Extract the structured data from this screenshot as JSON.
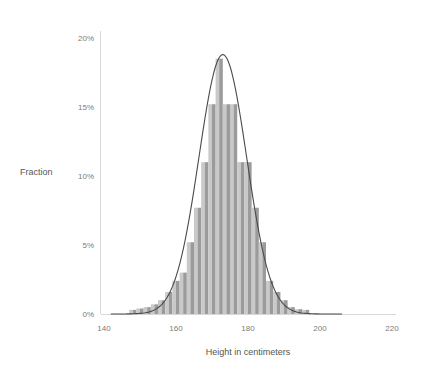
{
  "chart_data": {
    "type": "bar",
    "title": "",
    "subtitle": "",
    "xlabel": "Height in centimeters",
    "ylabel": "Fraction",
    "xlim": [
      140,
      224
    ],
    "ylim": [
      0,
      20
    ],
    "xticks": [
      140,
      160,
      180,
      200,
      220
    ],
    "xtick_labels": [
      "140",
      "160",
      "180",
      "200",
      "220"
    ],
    "yticks": [
      0,
      5,
      10,
      15,
      20
    ],
    "ytick_labels": [
      "0%",
      "5%",
      "10%",
      "15%",
      "20%"
    ],
    "y_unit": "percent",
    "grid": false,
    "legend": null,
    "bin_width": 2,
    "categories": [
      "148",
      "150",
      "152",
      "154",
      "156",
      "158",
      "160",
      "162",
      "164",
      "166",
      "168",
      "170",
      "172",
      "174",
      "176",
      "178",
      "180",
      "182",
      "184",
      "186",
      "188",
      "190",
      "192",
      "194",
      "196"
    ],
    "values": [
      0.3,
      0.4,
      0.5,
      0.7,
      1.0,
      1.6,
      2.4,
      3.0,
      5.2,
      7.7,
      11.0,
      15.2,
      18.5,
      15.2,
      15.2,
      11.0,
      11.0,
      7.7,
      5.2,
      2.4,
      1.6,
      1.0,
      0.5,
      0.35,
      0.3
    ],
    "bar_colors": [
      "#c9c9c9",
      "#9b9b9b"
    ],
    "overlay": {
      "type": "line",
      "name": "normal density curve",
      "color": "#4a4a4a",
      "mean": 173,
      "peak_value": 18.8
    }
  },
  "axes": {
    "x_label": "Height in centimeters",
    "y_label": "Fraction"
  },
  "colors": {
    "background": "#ffffff",
    "axis": "#d8d8d8",
    "tick_text": "#7b7b7b",
    "axis_title": "#555555",
    "bar_light": "#c9c9c9",
    "bar_dark": "#9b9b9b",
    "curve": "#4a4a4a"
  }
}
